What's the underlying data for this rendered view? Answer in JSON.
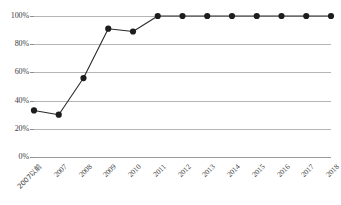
{
  "chart_data": {
    "type": "line",
    "title": "",
    "subtitle": "",
    "xlabel": "",
    "ylabel": "",
    "categories": [
      "2007以前",
      "2007",
      "2008",
      "2009",
      "2010",
      "2011",
      "2012",
      "2013",
      "2014",
      "2015",
      "2016",
      "2017",
      "2018"
    ],
    "values": [
      33,
      30,
      56,
      91,
      89,
      100,
      100,
      100,
      100,
      100,
      100,
      100,
      100
    ],
    "value_suffix": "%",
    "ylim": [
      0,
      100
    ],
    "ytick_labels": [
      "0%",
      "20%",
      "40%",
      "60%",
      "80%",
      "100%"
    ],
    "ytick_values": [
      0,
      20,
      40,
      60,
      80,
      100
    ],
    "grid": true,
    "legend": false,
    "legend_position": "none",
    "series": [
      {
        "name": "",
        "values": [
          33,
          30,
          56,
          91,
          89,
          100,
          100,
          100,
          100,
          100,
          100,
          100,
          100
        ],
        "color": "#2b2b2b",
        "marker": "circle"
      }
    ]
  },
  "style": {
    "background": "#ffffff",
    "grid_color": "#b5b5b5",
    "axis_color": "#9a9a9a",
    "line_color": "#2b2b2b",
    "marker_color": "#1d1d1d",
    "text_color": "#3d3d3d"
  }
}
